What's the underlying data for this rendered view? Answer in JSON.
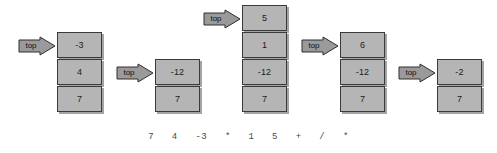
{
  "diagram": {
    "type": "stack-evaluation-sequence",
    "arrow_label": "top",
    "expression": "7   4   -3   *   1   5   +   /   *",
    "colors": {
      "cell_fill": "#b5b5b5",
      "cell_border": "#3a3a3a",
      "arrow_fill": "#9a9a9a",
      "arrow_border": "#2e2e2e",
      "text": "#1c1c1c",
      "expression_text": "#4a4a4a",
      "background": "#ffffff"
    },
    "stacks": [
      {
        "id": "stack-1",
        "cells": [
          "-3",
          "4",
          "7"
        ],
        "left": 57,
        "top": 32,
        "arrow_left": 18,
        "arrow_top": 36
      },
      {
        "id": "stack-2",
        "cells": [
          "-12",
          "7"
        ],
        "left": 155,
        "top": 59,
        "arrow_left": 116,
        "arrow_top": 63
      },
      {
        "id": "stack-3",
        "cells": [
          "5",
          "1",
          "-12",
          "7"
        ],
        "left": 242,
        "top": 5,
        "arrow_left": 203,
        "arrow_top": 9
      },
      {
        "id": "stack-4",
        "cells": [
          "6",
          "-12",
          "7"
        ],
        "left": 340,
        "top": 32,
        "arrow_left": 301,
        "arrow_top": 36
      },
      {
        "id": "stack-5",
        "cells": [
          "-2",
          "7"
        ],
        "left": 437,
        "top": 59,
        "arrow_left": 398,
        "arrow_top": 63
      }
    ]
  }
}
